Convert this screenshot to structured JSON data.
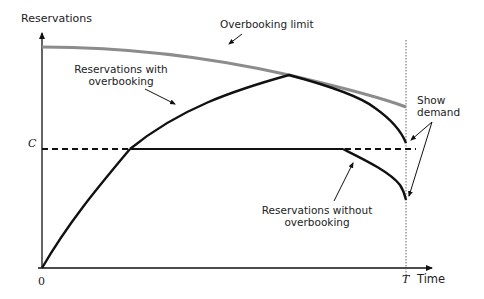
{
  "diagram": {
    "y_axis_label": "Reservations",
    "x_axis_label": "Time",
    "origin_label": "0",
    "capacity_label": "C",
    "end_time_label": "T",
    "annotations": {
      "overbooking_limit": "Overbooking limit",
      "with_overbooking_line1": "Reservations with",
      "with_overbooking_line2": "overbooking",
      "without_overbooking_line1": "Reservations without",
      "without_overbooking_line2": "overbooking",
      "show_demand_line1": "Show",
      "show_demand_line2": "demand"
    },
    "colors": {
      "axis": "#111111",
      "curves": "#111111",
      "overbooking_limit": "#8c8c8c",
      "t_marker": "#555555"
    }
  }
}
